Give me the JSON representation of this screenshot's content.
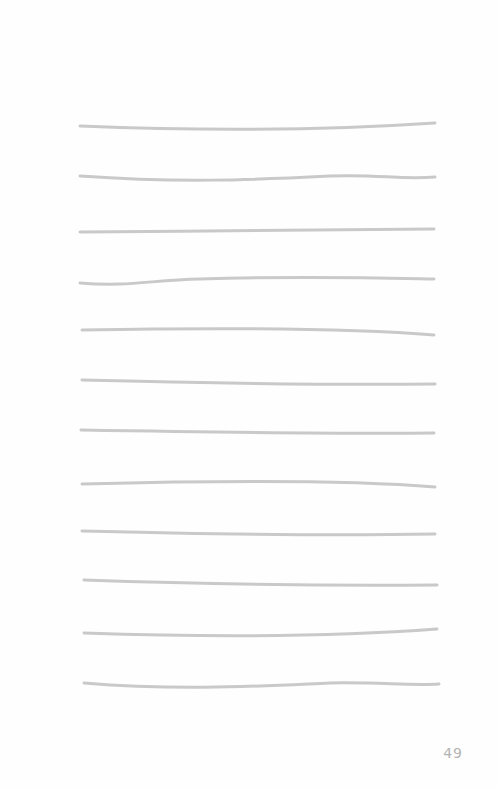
{
  "page": {
    "page_number": "49",
    "line_color": "#c9c9c9",
    "line_count": 12,
    "lines": [
      {
        "d": "M80 126 C 180 130, 300 132, 435 123"
      },
      {
        "d": "M80 176 C 180 183, 250 180, 330 176 C 380 174, 400 180, 435 177"
      },
      {
        "d": "M80 232 C 200 231, 330 230, 434 229"
      },
      {
        "d": "M80 283 C 130 287, 150 280, 200 279 C 300 276, 380 278, 434 279"
      },
      {
        "d": "M82 330 C 200 328, 350 328, 434 335"
      },
      {
        "d": "M82 380 C 200 383, 330 385, 435 384"
      },
      {
        "d": "M81 430 C 200 432, 330 434, 434 433"
      },
      {
        "d": "M82 484 C 200 481, 350 480, 435 487"
      },
      {
        "d": "M82 531 C 200 534, 330 536, 435 534"
      },
      {
        "d": "M84 580 C 200 584, 330 586, 437 585"
      },
      {
        "d": "M84 633 C 200 637, 330 637, 437 629"
      },
      {
        "d": "M84 683 C 180 691, 260 686, 330 683 C 380 682, 410 686, 439 684"
      }
    ]
  }
}
